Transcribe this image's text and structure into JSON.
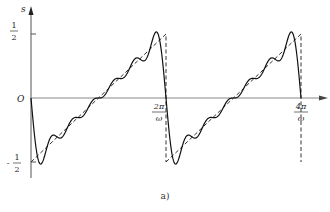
{
  "chart_data": {
    "type": "line",
    "title": "",
    "caption": "a)",
    "xlabel": "",
    "ylabel": "s",
    "x_ticks": [
      {
        "label": "2π/ω",
        "num": "2π",
        "den": "ω",
        "value": 1
      },
      {
        "label": "4π/ω",
        "num": "4π",
        "den": "ω",
        "value": 2
      }
    ],
    "y_ticks": [
      {
        "label": "1/2",
        "value": 0.5
      },
      {
        "label": "O",
        "value": 0
      },
      {
        "label": "-1/2",
        "value": -0.5
      }
    ],
    "xlim": [
      0,
      2.15
    ],
    "ylim": [
      -0.56,
      0.56
    ],
    "grid": false,
    "legend": null,
    "series": [
      {
        "name": "sawtooth (ideal)",
        "style": "dashed",
        "description": "Ideal sawtooth rising linearly from -1/2 to +1/2 over each period 2π/ω, dropping vertically back to -1/2 at each period boundary"
      },
      {
        "name": "Fourier partial sum",
        "style": "solid",
        "description": "Truncated Fourier approximation of the sawtooth with ripples and Gibbs overshoot near discontinuities",
        "overshoot_peak": 0.58,
        "undershoot_trough": -0.58
      }
    ],
    "periods": 2,
    "harmonics": 6
  },
  "axis": {
    "y_label": "s",
    "origin_label": "O",
    "half_num": "1",
    "half_den": "2",
    "neg_sign": "-"
  },
  "caption": "a)"
}
